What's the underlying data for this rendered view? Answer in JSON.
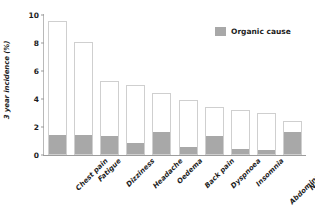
{
  "chart_data": {
    "type": "bar",
    "title": "",
    "xlabel": "",
    "ylabel": "3 year incidence (%)",
    "ylim": [
      0,
      10
    ],
    "yticks": [
      "0",
      "2",
      "4",
      "6",
      "8",
      "10"
    ],
    "grid": false,
    "stacked": true,
    "legend_position": "top-right",
    "categories": [
      "Chest pain",
      "Fatigue",
      "Dizziness",
      "Headache",
      "Oedema",
      "Back pain",
      "Dyspnoea",
      "Insomnia",
      "Abdominal pain",
      "Numbness"
    ],
    "series": [
      {
        "name": "Organic cause",
        "color": "#a8a8a8",
        "values": [
          1.35,
          1.35,
          1.3,
          0.8,
          1.6,
          0.5,
          1.3,
          0.35,
          0.3,
          1.6
        ]
      },
      {
        "name": "Total incidence",
        "color": "#ffffff",
        "values": [
          9.6,
          8.1,
          5.3,
          5.0,
          4.4,
          3.9,
          3.4,
          3.2,
          3.0,
          2.4
        ]
      }
    ]
  },
  "legend": {
    "entries": [
      {
        "label": "Organic cause",
        "color": "#a8a8a8"
      }
    ]
  },
  "colors": {
    "organic": "#a8a8a8",
    "bar_outline": "#cfcfcf",
    "axis": "#9d9d9d",
    "text": "#1d1d1d",
    "background": "#ffffff"
  }
}
